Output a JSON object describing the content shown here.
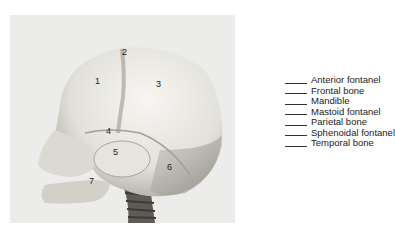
{
  "figure": {
    "labels": [
      {
        "number": "1",
        "x": 95,
        "y": 77
      },
      {
        "number": "2",
        "x": 122,
        "y": 49
      },
      {
        "number": "3",
        "x": 156,
        "y": 80
      },
      {
        "number": "4",
        "x": 106,
        "y": 127
      },
      {
        "number": "5",
        "x": 114,
        "y": 148
      },
      {
        "number": "6",
        "x": 167,
        "y": 163
      },
      {
        "number": "7",
        "x": 89,
        "y": 177
      }
    ]
  },
  "legend": {
    "items": [
      {
        "label": "Anterior fontanel"
      },
      {
        "label": "Frontal bone"
      },
      {
        "label": "Mandible"
      },
      {
        "label": "Mastoid fontanel"
      },
      {
        "label": "Parietal bone"
      },
      {
        "label": "Sphenoidal fontanel"
      },
      {
        "label": "Temporal bone"
      }
    ]
  }
}
